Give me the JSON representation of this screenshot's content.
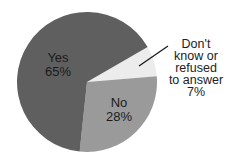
{
  "chart_data": {
    "type": "pie",
    "title": "",
    "categories": [
      "Yes",
      "No",
      "Don't know or refused to answer"
    ],
    "values": [
      65,
      28,
      7
    ],
    "unit": "%",
    "colors": [
      "#5f5f5f",
      "#9a9a9a",
      "#ececec"
    ],
    "start_angle_deg": -30,
    "direction": "clockwise",
    "slices": [
      {
        "label": "Yes",
        "value": 65,
        "value_label": "65%",
        "color": "#5f5f5f",
        "label_position": "inside"
      },
      {
        "label": "No",
        "value": 28,
        "value_label": "28%",
        "color": "#9a9a9a",
        "label_position": "inside"
      },
      {
        "label": "Don't know or refused to answer",
        "value": 7,
        "value_label": "7%",
        "color": "#ececec",
        "label_position": "outside",
        "leader_line": true
      }
    ],
    "legend": "none"
  },
  "labels": {
    "yes": {
      "name": "Yes",
      "pct": "65%"
    },
    "no": {
      "name": "No",
      "pct": "28%"
    },
    "dk": {
      "lines": [
        "Don't",
        "know or",
        "refused",
        "to answer"
      ],
      "pct": "7%"
    }
  },
  "geometry": {
    "cx": 87,
    "cy": 82,
    "r": 70
  }
}
